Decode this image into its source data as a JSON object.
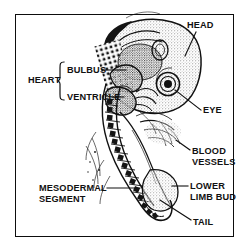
{
  "figure": {
    "frame_color": "#0d0d0d",
    "background": "#ffffff",
    "ink_color": "#111111"
  },
  "labels": {
    "head": "HEAD",
    "eye": "EYE",
    "blood_vessels": "BLOOD\nVESSELS",
    "lower_limb_bud": "LOWER\nLIMB BUD",
    "tail": "TAIL",
    "heart": "HEART",
    "bulbus": "BULBUS",
    "ventricle": "VENTRICLE",
    "mesodermal_segment": "MESODERMAL\nSEGMENT"
  },
  "illustration": {
    "name": "embryo-drawing",
    "description": "Line-art stipple drawing of a vertebrate embryo in lateral view showing head, eye, heart region, somites and tail"
  }
}
